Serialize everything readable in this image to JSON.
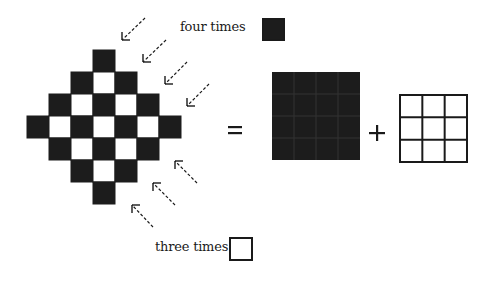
{
  "diagram": {
    "colors": {
      "dark": "#1c1c1c",
      "light": "#ffffff",
      "grid_line": "#2b2b2b",
      "text": "#1a1a1a"
    },
    "diamond": {
      "origin_x": 27,
      "origin_y": 50,
      "cell": 22,
      "rows": [
        "...B...",
        "..BWB..",
        ".BWBWB.",
        "BWBWBWB",
        ".BWBWB.",
        "..BWB..",
        "...B..."
      ],
      "black_count": 16,
      "white_count": 9
    },
    "equation": {
      "equals_symbol": "=",
      "plus_symbol": "+",
      "black_square": {
        "x": 272,
        "y": 72,
        "size": 88,
        "grid": 4
      },
      "white_square": {
        "x": 400,
        "y": 95,
        "size": 67,
        "grid": 3
      }
    },
    "arrows_four": [
      {
        "x1": 145,
        "y1": 18,
        "x2": 122,
        "y2": 40
      },
      {
        "x1": 166,
        "y1": 40,
        "x2": 143,
        "y2": 62
      },
      {
        "x1": 187,
        "y1": 62,
        "x2": 165,
        "y2": 84
      },
      {
        "x1": 209,
        "y1": 84,
        "x2": 187,
        "y2": 106
      }
    ],
    "arrows_three": [
      {
        "x1": 197,
        "y1": 183,
        "x2": 175,
        "y2": 161
      },
      {
        "x1": 175,
        "y1": 205,
        "x2": 153,
        "y2": 183
      },
      {
        "x1": 153,
        "y1": 227,
        "x2": 132,
        "y2": 205
      }
    ],
    "labels": {
      "four_times": "four times",
      "three_times": "three times"
    }
  }
}
